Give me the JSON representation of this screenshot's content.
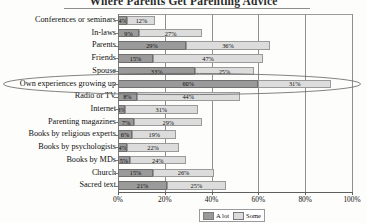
{
  "chart_data": {
    "type": "bar",
    "orientation": "horizontal",
    "stacked": true,
    "title": "Where Parents Get Parenting Advice",
    "xlabel": "",
    "ylabel": "",
    "xlim": [
      0,
      100
    ],
    "xticks": [
      "0%",
      "20%",
      "40%",
      "60%",
      "80%",
      "100%"
    ],
    "xtick_values": [
      0,
      20,
      40,
      60,
      80,
      100
    ],
    "grid": true,
    "legend_position": "bottom",
    "categories": [
      "Conferences or seminars",
      "In-laws",
      "Parents",
      "Friends",
      "Spouse",
      "Own experiences growing up",
      "Radio or TV",
      "Internet",
      "Parenting magazines",
      "Books by religious experts",
      "Books by psychologists",
      "Books by MDs",
      "Church",
      "Sacred text"
    ],
    "series": [
      {
        "name": "A lot",
        "color": "#9a9a9a",
        "values": [
          4,
          9,
          29,
          15,
          33,
          60,
          8,
          3,
          7,
          6,
          4,
          5,
          15,
          21
        ],
        "labels": [
          "4%",
          "9%",
          "29%",
          "15%",
          "33%",
          "60%",
          "8%",
          "3%",
          "7%",
          "6%",
          "4%",
          "5%",
          "15%",
          "21%"
        ]
      },
      {
        "name": "Some",
        "color": "#dcdcdc",
        "values": [
          12,
          27,
          36,
          47,
          25,
          31,
          44,
          31,
          29,
          19,
          22,
          24,
          26,
          25
        ],
        "labels": [
          "12%",
          "27%",
          "36%",
          "47%",
          "25%",
          "31%",
          "44%",
          "31%",
          "29%",
          "19%",
          "22%",
          "24%",
          "26%",
          "25%"
        ]
      }
    ],
    "annotations": [
      {
        "type": "ellipse",
        "target": "Own experiences growing up",
        "note": "hand-drawn oval highlighting the row"
      }
    ]
  },
  "legend": {
    "items": [
      {
        "label": "A lot",
        "color": "#9a9a9a"
      },
      {
        "label": "Some",
        "color": "#dcdcdc"
      }
    ]
  }
}
